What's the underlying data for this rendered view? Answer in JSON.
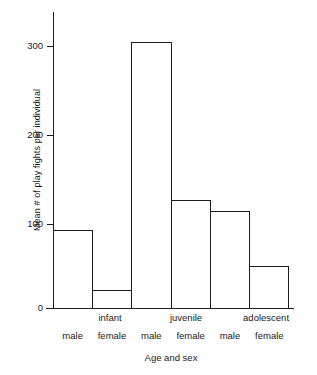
{
  "chart_data": {
    "type": "bar",
    "title": "",
    "xlabel": "Age and sex",
    "ylabel": "Mean # of play fights per individual",
    "categories": [
      "infant male",
      "infant female",
      "juvenile male",
      "juvenile female",
      "adolescent male",
      "adolescent female"
    ],
    "values": [
      90,
      21,
      305,
      124,
      112,
      48
    ],
    "ylim": [
      0,
      340
    ],
    "yticks": [
      0,
      100,
      200,
      300
    ],
    "ytick_labels": [
      "0",
      "100",
      "200",
      "300"
    ],
    "grid": false,
    "legend": null,
    "bar_style": {
      "fill": "#ffffff",
      "edge": "#1d1d1d",
      "edge_width": 1
    },
    "age_groups": [
      {
        "label": "",
        "span": 1
      },
      {
        "label": "infant",
        "span": 1
      },
      {
        "label": "",
        "span": 1
      },
      {
        "label": "juvenile",
        "span": 1
      },
      {
        "label": "",
        "span": 1
      },
      {
        "label": "adolescent",
        "span": 1
      }
    ],
    "age_group_labels": [
      "",
      "infant",
      "",
      "juvenile",
      "",
      "adolescent"
    ],
    "sex_labels": [
      "male",
      "female",
      "male",
      "female",
      "male",
      "female"
    ]
  },
  "axes": {
    "y_title": "Mean # of play fights per individual",
    "x_title": "Age and sex",
    "y_tick_0": "0",
    "y_tick_1": "100",
    "y_tick_2": "200",
    "y_tick_3": "300"
  },
  "labels": {
    "age_0": "",
    "age_1": "infant",
    "age_2": "",
    "age_3": "juvenile",
    "age_4": "",
    "age_5": "adolescent",
    "sex_0": "male",
    "sex_1": "female",
    "sex_2": "male",
    "sex_3": "female",
    "sex_4": "male",
    "sex_5": "female"
  },
  "colors": {
    "axis": "#1d1d1d",
    "bar_edge": "#1d1d1d",
    "bar_fill": "#ffffff",
    "text": "#1a1a1a",
    "background": "#ffffff"
  }
}
